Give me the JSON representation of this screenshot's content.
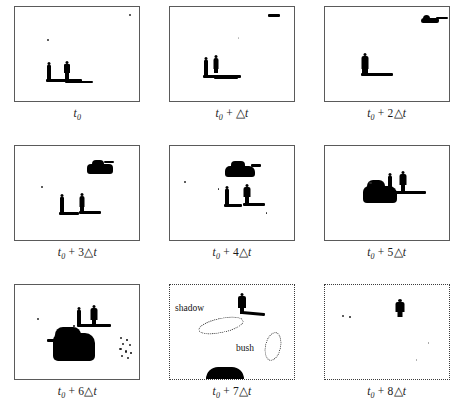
{
  "figure": {
    "columns": 3,
    "rows": 3,
    "background_color": "#ffffff",
    "silhouette_color": "#000000"
  },
  "panels": [
    {
      "id": "panel-1",
      "caption": "t0",
      "caption_parts": {
        "base": "t",
        "sub": "0",
        "offset": ""
      },
      "border_style": "solid",
      "objects": [
        "person",
        "person",
        "shadow",
        "speck",
        "speck"
      ],
      "object_count": 2
    },
    {
      "id": "panel-2",
      "caption": "t0 + △t",
      "caption_parts": {
        "base": "t",
        "sub": "0",
        "offset": "+ △t"
      },
      "border_style": "solid",
      "objects": [
        "person",
        "person",
        "shadow",
        "vehicle-far"
      ],
      "object_count": 3
    },
    {
      "id": "panel-3",
      "caption": "t0 + 2△t",
      "caption_parts": {
        "base": "t",
        "sub": "0",
        "offset": "+ 2△t"
      },
      "border_style": "solid",
      "objects": [
        "person-merged",
        "shadow",
        "tank"
      ],
      "object_count": 2
    },
    {
      "id": "panel-4",
      "caption": "t0 + 3△t",
      "caption_parts": {
        "base": "t",
        "sub": "0",
        "offset": "+ 3△t"
      },
      "border_style": "solid",
      "objects": [
        "person",
        "person",
        "shadow",
        "shadow",
        "tank"
      ],
      "object_count": 3
    },
    {
      "id": "panel-5",
      "caption": "t0 + 4△t",
      "caption_parts": {
        "base": "t",
        "sub": "0",
        "offset": "+ 4△t"
      },
      "border_style": "solid",
      "objects": [
        "tank",
        "person",
        "person",
        "shadow",
        "shadow",
        "speck"
      ],
      "object_count": 3
    },
    {
      "id": "panel-6",
      "caption": "t0 + 5△t",
      "caption_parts": {
        "base": "t",
        "sub": "0",
        "offset": "+ 5△t"
      },
      "border_style": "solid",
      "objects": [
        "tank",
        "person",
        "person",
        "shadow"
      ],
      "object_count": 3
    },
    {
      "id": "panel-7",
      "caption": "t0 + 6△t",
      "caption_parts": {
        "base": "t",
        "sub": "0",
        "offset": "+ 6△t"
      },
      "border_style": "solid",
      "objects": [
        "tank-large",
        "person",
        "person",
        "shadow",
        "noise-cluster",
        "speck"
      ],
      "object_count": 3
    },
    {
      "id": "panel-8",
      "caption": "t0 + 7△t",
      "caption_parts": {
        "base": "t",
        "sub": "0",
        "offset": "+ 7△t"
      },
      "border_style": "dotted",
      "objects": [
        "person",
        "shadow",
        "tank-partial",
        "annotation-shadow",
        "annotation-bush"
      ],
      "object_count": 2,
      "annotations": [
        {
          "label": "shadow",
          "shape": "dotted-ellipse"
        },
        {
          "label": "bush",
          "shape": "dotted-ellipse"
        }
      ]
    },
    {
      "id": "panel-9",
      "caption": "t0 + 8△t",
      "caption_parts": {
        "base": "t",
        "sub": "0",
        "offset": "+ 8△t"
      },
      "border_style": "dotted",
      "objects": [
        "person",
        "speck",
        "speck",
        "speck"
      ],
      "object_count": 1
    }
  ]
}
